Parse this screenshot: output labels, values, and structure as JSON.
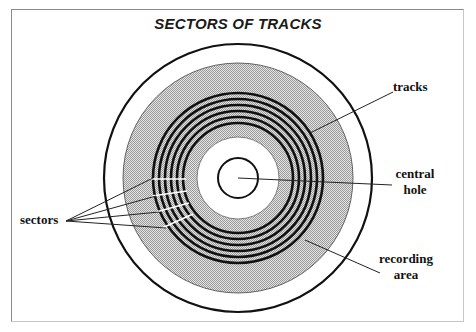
{
  "diagram": {
    "title": "SECTORS OF TRACKS",
    "labels": {
      "tracks": "tracks",
      "central_hole_line1": "central",
      "central_hole_line2": "hole",
      "sectors": "sectors",
      "recording_area_line1": "recording",
      "recording_area_line2": "area"
    },
    "colors": {
      "outline": "#111111",
      "recording_area_fill": "#c8c8c8",
      "background": "#ffffff",
      "frame": "#8a8a8a"
    },
    "geometry": {
      "center": [
        238,
        178
      ],
      "outer_radius": 134,
      "recording_area_radius": 116,
      "track_count": 6,
      "track_outer_radius": 86,
      "track_inner_radius": 56,
      "inner_white_radius": 41,
      "central_hole_radius": 20,
      "sector_count_indicated": 4
    }
  }
}
